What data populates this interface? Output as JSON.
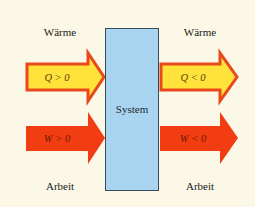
{
  "diagram": {
    "system_label": "System",
    "left": {
      "heat_label": "Wärme",
      "work_label": "Arbeit",
      "heat_arrow": {
        "text": "Q > 0",
        "direction": "in"
      },
      "work_arrow": {
        "text": "W > 0",
        "direction": "in"
      }
    },
    "right": {
      "heat_label": "Wärme",
      "work_label": "Arbeit",
      "heat_arrow": {
        "text": "Q < 0",
        "direction": "out"
      },
      "work_arrow": {
        "text": "W < 0",
        "direction": "out"
      }
    },
    "colors": {
      "background": "#fbf8e7",
      "system_fill": "#a9d5f1",
      "system_border": "#3c4a55",
      "heat_fill": "#ffe33b",
      "heat_border": "#e8481c",
      "work_fill": "#f23c12",
      "arrow_text_heat": "#5a3a10",
      "arrow_text_work": "#6a1a08"
    }
  }
}
